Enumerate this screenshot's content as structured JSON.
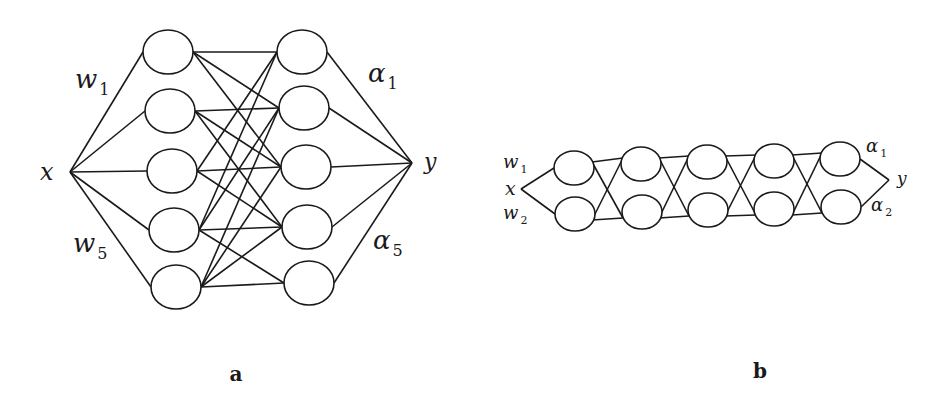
{
  "diagram_a": {
    "caption": "a",
    "input_label": "x",
    "output_label": "y",
    "input_point": [
      70,
      172
    ],
    "output_point": [
      412,
      163
    ],
    "input_weights": [
      {
        "base": "w",
        "sub": "1",
        "pos": [
          75,
          88
        ]
      },
      {
        "base": "w",
        "sub": "5",
        "pos": [
          73,
          252
        ]
      }
    ],
    "output_weights": [
      {
        "base": "α",
        "sub": "1",
        "pos": [
          368,
          82
        ]
      },
      {
        "base": "α",
        "sub": "5",
        "pos": [
          373,
          249
        ]
      }
    ],
    "left_nodes": [
      [
        168,
        52
      ],
      [
        170,
        111
      ],
      [
        172,
        171
      ],
      [
        174,
        230
      ],
      [
        176,
        287
      ]
    ],
    "right_nodes": [
      [
        302,
        52
      ],
      [
        304,
        108
      ],
      [
        306,
        167
      ],
      [
        307,
        227
      ],
      [
        309,
        283
      ]
    ],
    "node_rx": 25,
    "node_ry": 22,
    "edges": [
      [
        0,
        0
      ],
      [
        0,
        1
      ],
      [
        0,
        2
      ],
      [
        1,
        1
      ],
      [
        1,
        2
      ],
      [
        1,
        3
      ],
      [
        2,
        0
      ],
      [
        2,
        2
      ],
      [
        2,
        3
      ],
      [
        3,
        0
      ],
      [
        3,
        1
      ],
      [
        3,
        3
      ],
      [
        3,
        4
      ],
      [
        4,
        1
      ],
      [
        4,
        2
      ],
      [
        4,
        3
      ],
      [
        4,
        4
      ]
    ]
  },
  "diagram_b": {
    "caption": "b",
    "input_label": "x",
    "output_label": "y",
    "input_point": [
      521,
      189
    ],
    "output_point": [
      889,
      180
    ],
    "input_weights": [
      {
        "base": "w",
        "sub": "1",
        "pos": [
          503,
          168
        ]
      },
      {
        "base": "w",
        "sub": "2",
        "pos": [
          503,
          219
        ]
      }
    ],
    "output_weights": [
      {
        "base": "α",
        "sub": "1",
        "pos": [
          866,
          152
        ]
      },
      {
        "base": "α",
        "sub": "2",
        "pos": [
          871,
          211
        ]
      }
    ],
    "columns": [
      {
        "top": [
          574,
          168
        ],
        "bottom": [
          575,
          214
        ]
      },
      {
        "top": [
          641,
          164
        ],
        "bottom": [
          642,
          212
        ]
      },
      {
        "top": [
          707,
          162
        ],
        "bottom": [
          708,
          210
        ]
      },
      {
        "top": [
          774,
          161
        ],
        "bottom": [
          774,
          209
        ]
      },
      {
        "top": [
          840,
          159
        ],
        "bottom": [
          841,
          207
        ]
      }
    ],
    "node_rx": 20,
    "node_ry": 17
  }
}
